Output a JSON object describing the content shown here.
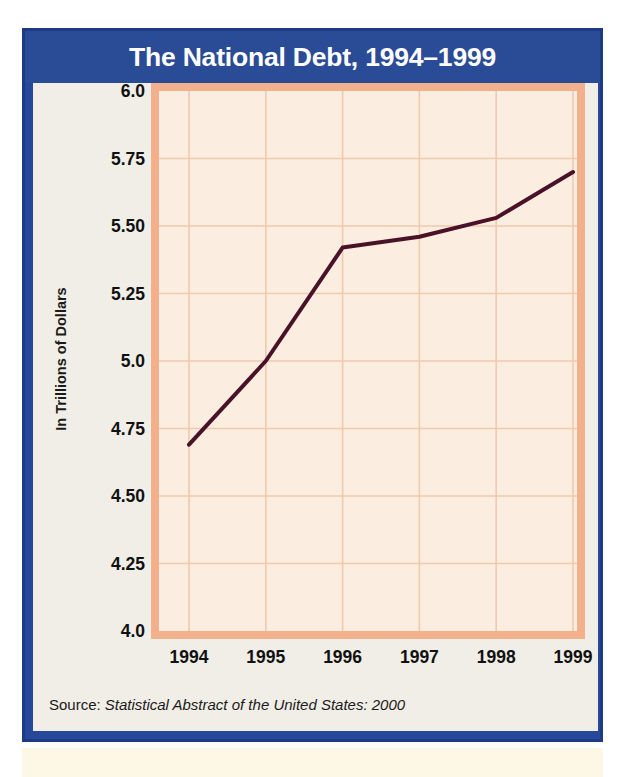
{
  "figure": {
    "title": "The National Debt, 1994–1999",
    "source_label": "Source:",
    "source_reference": "Statistical Abstract of the United States: 2000",
    "colors": {
      "frame_navy": "#26479a",
      "title_bar": "#2a4b96",
      "panel_cream": "#f0eee6",
      "plot_border_salmon": "#f2b18c",
      "plot_background": "#fbeee0",
      "gridline": "#f0c9ae",
      "data_line": "#4a1228",
      "title_text": "#ffffff",
      "axis_text": "#111111"
    }
  },
  "chart_data": {
    "type": "line",
    "title": "The National Debt, 1994–1999",
    "xlabel": "",
    "ylabel": "In Trillions of Dollars",
    "categories": [
      "1994",
      "1995",
      "1996",
      "1997",
      "1998",
      "1999"
    ],
    "x": [
      1994,
      1995,
      1996,
      1997,
      1998,
      1999
    ],
    "values": [
      4.69,
      5.0,
      5.42,
      5.46,
      5.53,
      5.7
    ],
    "series": [
      {
        "name": "National Debt",
        "values": [
          4.69,
          5.0,
          5.42,
          5.46,
          5.53,
          5.7
        ]
      }
    ],
    "ylim": [
      4.0,
      6.0
    ],
    "ytick_labels": [
      "6.0",
      "5.75",
      "5.50",
      "5.25",
      "5.0",
      "4.75",
      "4.50",
      "4.25",
      "4.0"
    ],
    "ytick_values": [
      6.0,
      5.75,
      5.5,
      5.25,
      5.0,
      4.75,
      4.5,
      4.25,
      4.0
    ],
    "xtick_labels": [
      "1994",
      "1995",
      "1996",
      "1997",
      "1998",
      "1999"
    ],
    "grid": true,
    "legend": "none",
    "units": "trillions of dollars"
  }
}
